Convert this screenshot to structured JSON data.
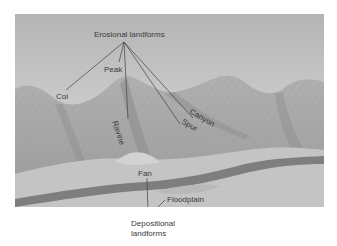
{
  "diagram": {
    "groups": {
      "erosional": "Erosional landforms",
      "depositional_line1": "Depositional",
      "depositional_line2": "landforms"
    },
    "labels": {
      "peak": "Peak",
      "col": "Col",
      "ravine": "Ravine",
      "canyon": "Canyon",
      "spur": "Spur",
      "fan": "Fan",
      "floodplain": "Floodplain"
    },
    "colors": {
      "sky_top": "#b8b8b8",
      "sky_bottom": "#e2e2e2",
      "mountain": "#a8a8a8",
      "mountain_shadow": "#8a8a8a",
      "valley": "#c6c6c6",
      "river": "#7a7a7a",
      "leader_line": "#404040"
    }
  }
}
